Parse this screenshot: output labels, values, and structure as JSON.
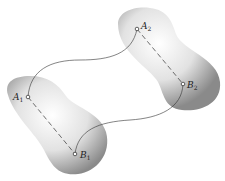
{
  "diagram": {
    "bodies": [
      {
        "name": "body-1",
        "points": [
          {
            "label": "A",
            "sub": "1",
            "x": 28,
            "y": 97
          },
          {
            "label": "B",
            "sub": "1",
            "x": 75,
            "y": 154
          }
        ]
      },
      {
        "name": "body-2",
        "points": [
          {
            "label": "A",
            "sub": "2",
            "x": 137,
            "y": 29
          },
          {
            "label": "B",
            "sub": "2",
            "x": 183,
            "y": 84
          }
        ]
      }
    ],
    "labels": {
      "a1": "A",
      "a1_sub": "1",
      "b1": "B",
      "b1_sub": "1",
      "a2": "A",
      "a2_sub": "2",
      "b2": "B",
      "b2_sub": "2"
    }
  }
}
